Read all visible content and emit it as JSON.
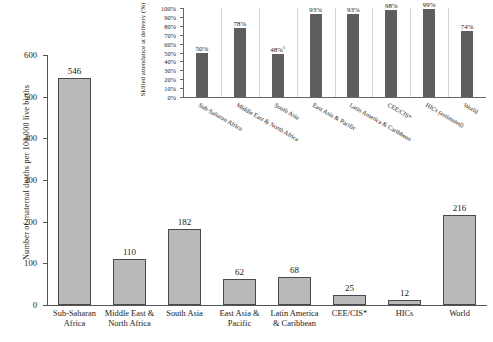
{
  "chart_data": [
    {
      "id": "main",
      "type": "bar",
      "title": "",
      "xlabel": "",
      "ylabel": "Number of maternal deaths per 100,000 live births",
      "ylim": [
        0,
        600
      ],
      "yticks": [
        0,
        100,
        200,
        300,
        400,
        500,
        600
      ],
      "ytick_labels": [
        "0",
        "100",
        "200",
        "300",
        "400",
        "500",
        "600"
      ],
      "grid": false,
      "legend": "none",
      "bar_color": "#b9b9b9",
      "bar_edge_color": "#4a4a4a",
      "categories": [
        "Sub-Saharan\nAfrica",
        "Middle East &\nNorth Africa",
        "South Asia",
        "East Asia &\nPacific",
        "Latin America\n& Caribbean",
        "CEE/CIS*",
        "HICs",
        "World"
      ],
      "values": [
        546,
        110,
        182,
        62,
        68,
        25,
        12,
        216
      ],
      "value_labels": [
        "546",
        "110",
        "182",
        "62",
        "68",
        "25",
        "12",
        "216"
      ]
    },
    {
      "id": "inset",
      "type": "bar",
      "title": "",
      "xlabel": "",
      "ylabel": "Skilled attendance at delivery (%)",
      "ylim": [
        0,
        100
      ],
      "yticks": [
        0,
        10,
        20,
        30,
        40,
        50,
        60,
        70,
        80,
        90,
        100
      ],
      "ytick_labels": [
        "0%",
        "10%",
        "20%",
        "30%",
        "40%",
        "50%",
        "60%",
        "70%",
        "80%",
        "90%",
        "100%"
      ],
      "grid": true,
      "legend": "none",
      "bar_color": "#5e5e5e",
      "categories": [
        "Sub-Saharan Africa",
        "Middle East & North Africa",
        "South Asia",
        "East Asia & Pacific",
        "Latin America & Caribbean",
        "CEE/CIS*",
        "HICs (estimated)",
        "World"
      ],
      "values": [
        50,
        78,
        48,
        93,
        93,
        98,
        99,
        74
      ],
      "value_labels": [
        "50%",
        "78%",
        "48%",
        "93%",
        "93%",
        "98%",
        "99%",
        "74%"
      ],
      "value_label_footnotes": [
        "",
        "",
        "1",
        "",
        "",
        "",
        "",
        ""
      ]
    }
  ]
}
